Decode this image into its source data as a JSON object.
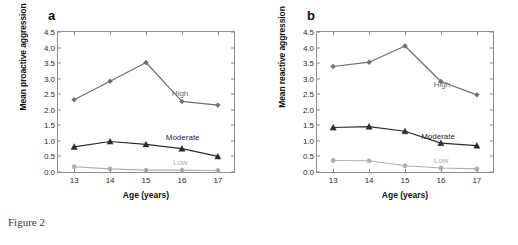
{
  "figure": {
    "caption": "Figure 2"
  },
  "panels": [
    {
      "key": "a",
      "label": "a",
      "ylabel": "Mean proactive aggression",
      "xlabel": "Age (years)",
      "tags": [
        {
          "text": "High",
          "color": "#6f6f6f",
          "x": 15.72,
          "y": 2.55
        },
        {
          "text": "Moderate",
          "color": "#2b2b2b",
          "x": 15.55,
          "y": 1.12
        },
        {
          "text": "Low",
          "color": "#b0b0b0",
          "x": 15.75,
          "y": 0.33
        }
      ]
    },
    {
      "key": "b",
      "label": "b",
      "ylabel": "Mean reactive aggression",
      "xlabel": "Age (years)",
      "tags": [
        {
          "text": "High",
          "color": "#6f6f6f",
          "x": 15.8,
          "y": 2.82
        },
        {
          "text": "Moderate",
          "color": "#2b2b2b",
          "x": 15.45,
          "y": 1.15
        },
        {
          "text": "Low",
          "color": "#b0b0b0",
          "x": 15.8,
          "y": 0.38
        }
      ]
    }
  ],
  "chart_data": [
    {
      "type": "line",
      "panel": "a",
      "title": "a",
      "xlabel": "Age (years)",
      "ylabel": "Mean proactive aggression",
      "categories": [
        13,
        14,
        15,
        16,
        17
      ],
      "x": [
        13,
        14,
        15,
        16,
        17
      ],
      "xtick_labels": [
        "13",
        "14",
        "15",
        "16",
        "17"
      ],
      "ytick_labels": [
        "0.0",
        "0.5",
        "1.0",
        "1.5",
        "2.0",
        "2.5",
        "3.0",
        "3.5",
        "4.0",
        "4.5"
      ],
      "ytick_values": [
        0.0,
        0.5,
        1.0,
        1.5,
        2.0,
        2.5,
        3.0,
        3.5,
        4.0,
        4.5
      ],
      "ylim": [
        0.0,
        4.5
      ],
      "xlim": [
        12.55,
        17.45
      ],
      "grid": false,
      "legend": "inline-right",
      "series": [
        {
          "name": "High",
          "values": [
            2.32,
            2.92,
            3.52,
            2.27,
            2.15
          ],
          "color": "#6f6f6f",
          "marker": "diamond"
        },
        {
          "name": "Moderate",
          "values": [
            0.81,
            0.98,
            0.89,
            0.75,
            0.5
          ],
          "color": "#2b2b2b",
          "marker": "triangle"
        },
        {
          "name": "Low",
          "values": [
            0.17,
            0.1,
            0.06,
            0.06,
            0.05
          ],
          "color": "#b0b0b0",
          "marker": "circle"
        }
      ]
    },
    {
      "type": "line",
      "panel": "b",
      "title": "b",
      "xlabel": "Age (years)",
      "ylabel": "Mean reactive aggression",
      "categories": [
        13,
        14,
        15,
        16,
        17
      ],
      "x": [
        13,
        14,
        15,
        16,
        17
      ],
      "xtick_labels": [
        "13",
        "14",
        "15",
        "16",
        "17"
      ],
      "ytick_labels": [
        "0.0",
        "0.5",
        "1.0",
        "1.5",
        "2.0",
        "2.5",
        "3.0",
        "3.5",
        "4.0",
        "4.5"
      ],
      "ytick_values": [
        0.0,
        0.5,
        1.0,
        1.5,
        2.0,
        2.5,
        3.0,
        3.5,
        4.0,
        4.5
      ],
      "ylim": [
        0.0,
        4.5
      ],
      "xlim": [
        12.55,
        17.45
      ],
      "grid": false,
      "legend": "inline-right",
      "series": [
        {
          "name": "High",
          "values": [
            3.39,
            3.53,
            4.05,
            2.91,
            2.48
          ],
          "color": "#6f6f6f",
          "marker": "diamond"
        },
        {
          "name": "Moderate",
          "values": [
            1.43,
            1.46,
            1.31,
            0.93,
            0.85
          ],
          "color": "#2b2b2b",
          "marker": "triangle"
        },
        {
          "name": "Low",
          "values": [
            0.37,
            0.36,
            0.2,
            0.13,
            0.1
          ],
          "color": "#b0b0b0",
          "marker": "circle"
        }
      ]
    }
  ]
}
